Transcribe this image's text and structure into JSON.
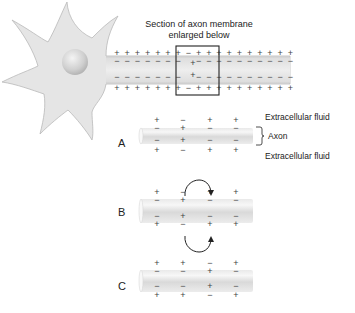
{
  "title": {
    "line1": "Section of axon membrane",
    "line2": "enlarged below"
  },
  "labels": {
    "extracellular_top": "Extracellular fluid",
    "axon": "Axon",
    "extracellular_bottom": "Extracellular fluid"
  },
  "panels": [
    {
      "id": "A",
      "label": "A",
      "outer_top": [
        "+",
        "−",
        "+",
        "+"
      ],
      "inner_top": [
        "−",
        "+",
        "−",
        "−"
      ],
      "inner_bottom": [
        "−",
        "+",
        "−",
        "−"
      ],
      "outer_bottom": [
        "+",
        "−",
        "+",
        "+"
      ]
    },
    {
      "id": "B",
      "label": "B",
      "outer_top": [
        "+",
        "−",
        "+",
        "+"
      ],
      "inner_top": [
        "−",
        "+",
        "−",
        "−"
      ],
      "inner_bottom": [
        "−",
        "+",
        "−",
        "−"
      ],
      "outer_bottom": [
        "+",
        "−",
        "+",
        "+"
      ]
    },
    {
      "id": "C",
      "label": "C",
      "outer_top": [
        "+",
        "+",
        "−",
        "+"
      ],
      "inner_top": [
        "−",
        "−",
        "+",
        "−"
      ],
      "inner_bottom": [
        "−",
        "−",
        "+",
        "−"
      ],
      "outer_bottom": [
        "+",
        "+",
        "−",
        "+"
      ]
    }
  ],
  "axon_charges": {
    "outer_top": [
      "+",
      "+",
      "+",
      "+",
      "+",
      "+",
      "+",
      "−",
      "+",
      "+",
      "+",
      "+",
      "+",
      "+",
      "+",
      "+",
      "+",
      "+"
    ],
    "inner_top": [
      "−",
      "−",
      "−",
      "−",
      "−",
      "−",
      "−",
      "+",
      "−",
      "−",
      "−",
      "−",
      "−",
      "−",
      "−",
      "−",
      "−",
      "−"
    ],
    "inner_bottom": [
      "−",
      "−",
      "−",
      "−",
      "−",
      "−",
      "−",
      "+",
      "−",
      "−",
      "−",
      "−",
      "−",
      "−",
      "−",
      "−",
      "−",
      "−"
    ],
    "outer_bottom": [
      "+",
      "+",
      "+",
      "+",
      "+",
      "+",
      "+",
      "−",
      "+",
      "+",
      "+",
      "+",
      "+",
      "+",
      "+",
      "+",
      "+",
      "+"
    ]
  },
  "colors": {
    "cell_fill": "#e4e4e4",
    "cell_stroke": "#b8b8b8",
    "axon_fill": "#e6e6e6",
    "charge": "#444444",
    "box": "#222222",
    "text": "#222222"
  }
}
